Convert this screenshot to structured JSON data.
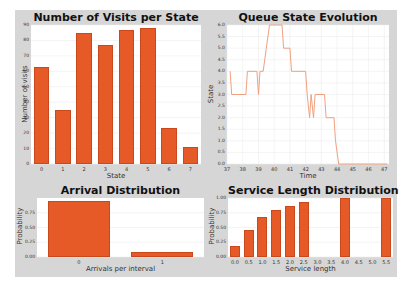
{
  "colors": {
    "bar": "#e65a28",
    "line": "#f0a080",
    "panel": "#d6d6d6",
    "plot_bg": "#ffffff"
  },
  "chart_data": [
    {
      "type": "bar",
      "title": "Number of Visits per State",
      "xlabel": "State",
      "ylabel": "Number of visits",
      "categories": [
        "0",
        "1",
        "2",
        "3",
        "4",
        "5",
        "6",
        "7"
      ],
      "values": [
        63,
        35,
        85,
        77,
        87,
        88,
        23,
        11
      ],
      "yticks": [
        "0",
        "10",
        "20",
        "30",
        "40",
        "50",
        "60",
        "70",
        "80",
        "90"
      ],
      "ylim": [
        0,
        90
      ],
      "grid": true
    },
    {
      "type": "line",
      "title": "Queue State Evolution",
      "xlabel": "Time",
      "ylabel": "State",
      "xticks": [
        "37",
        "38",
        "39",
        "40",
        "41",
        "42",
        "43",
        "44",
        "45",
        "46",
        "47"
      ],
      "yticks": [
        "0.0",
        "0.5",
        "1.0",
        "1.5",
        "2.0",
        "2.5",
        "3.0",
        "3.5",
        "4.0",
        "4.5",
        "5.0",
        "5.5",
        "6.0"
      ],
      "xlim": [
        37,
        47.3
      ],
      "ylim": [
        0,
        6.0
      ],
      "grid": true,
      "x": [
        37.2,
        37.3,
        38.2,
        38.3,
        38.9,
        39.0,
        39.1,
        39.3,
        39.5,
        39.7,
        40.5,
        40.6,
        41.0,
        41.1,
        42.0,
        42.1,
        42.25,
        42.35,
        42.5,
        42.6,
        43.2,
        43.3,
        43.8,
        43.9,
        44.1,
        47.2
      ],
      "y": [
        4,
        3,
        3,
        4,
        4,
        3,
        4,
        4,
        5,
        6,
        6,
        5,
        5,
        4,
        4,
        3,
        2,
        3,
        2,
        3,
        3,
        2,
        2,
        1,
        0,
        0
      ]
    },
    {
      "type": "bar",
      "title": "Arrival Distribution",
      "xlabel": "Arrivals per interval",
      "ylabel": "Probability",
      "categories": [
        "0",
        "1"
      ],
      "values": [
        0.95,
        0.09
      ],
      "yticks": [
        "0.00",
        "0.25",
        "0.50",
        "0.75"
      ],
      "ylim": [
        0,
        1.0
      ],
      "grid": true
    },
    {
      "type": "bar",
      "title": "Service Length Distribution",
      "xlabel": "Service length",
      "ylabel": "Probability",
      "categories": [
        "0.0",
        "0.5",
        "1.0",
        "1.5",
        "2.0",
        "2.5",
        "3.0",
        "3.5",
        "4.0",
        "4.5",
        "5.0",
        "5.5"
      ],
      "values": [
        0.18,
        0.45,
        0.68,
        0.8,
        0.87,
        0.93,
        0,
        0,
        1.0,
        0,
        0,
        1.0
      ],
      "yticks": [
        "0.00",
        "0.25",
        "0.50",
        "0.75",
        "1.00"
      ],
      "ylim": [
        0,
        1.0
      ],
      "grid": true
    }
  ]
}
